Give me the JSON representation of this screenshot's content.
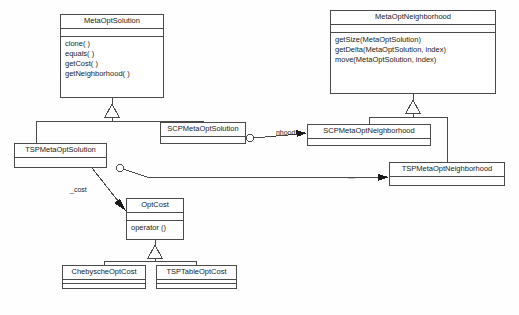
{
  "diagram": {
    "type": "uml-class-diagram",
    "background": "#fefefe",
    "line_color": "#4a4a4a"
  },
  "classes": [
    {
      "id": "meta-opt-solution",
      "name": "MetaOptSolution",
      "x": 60,
      "y": 14,
      "w": 104,
      "h": 84,
      "attrs_h": 7,
      "operations": [
        "clone( )",
        "equals( )",
        "getCost( )",
        "getNeighborhood( )"
      ]
    },
    {
      "id": "meta-opt-neighborhood",
      "name": "MetaOptNeighborhood",
      "x": 330,
      "y": 10,
      "w": 166,
      "h": 84,
      "attrs_h": 7,
      "operations": [
        "getSize(MetaOptSolution)",
        "getDelta(MetaOptSolution, index)",
        "move(MetaOptSolution, index)"
      ]
    },
    {
      "id": "scp-meta-opt-solution",
      "name": "SCPMetaOptSolution",
      "x": 160,
      "y": 122,
      "w": 86,
      "h": 22,
      "attrs_h": 0,
      "operations": []
    },
    {
      "id": "scp-meta-opt-neighborhood",
      "name": "SCPMetaOptNeighborhood",
      "x": 307,
      "y": 124,
      "w": 124,
      "h": 22,
      "attrs_h": 0,
      "operations": []
    },
    {
      "id": "tsp-meta-opt-solution",
      "name": "TSPMetaOptSolution",
      "x": 14,
      "y": 143,
      "w": 93,
      "h": 25,
      "attrs_h": 0,
      "operations": []
    },
    {
      "id": "tsp-meta-opt-neighborhood",
      "name": "TSPMetaOptNeighborhood",
      "x": 389,
      "y": 162,
      "w": 116,
      "h": 24,
      "attrs_h": 0,
      "operations": []
    },
    {
      "id": "opt-cost",
      "name": "OptCost",
      "x": 126,
      "y": 198,
      "w": 58,
      "h": 42,
      "attrs_h": 7,
      "operations": [
        "operator ()"
      ]
    },
    {
      "id": "chebysche-opt-cost",
      "name": "ChebyscheOptCost",
      "x": 62,
      "y": 265,
      "w": 84,
      "h": 24,
      "attrs_h": 7,
      "operations": []
    },
    {
      "id": "tsp-table-opt-cost",
      "name": "TSPTableOptCost",
      "x": 156,
      "y": 265,
      "w": 81,
      "h": 24,
      "attrs_h": 7,
      "operations": []
    }
  ],
  "edge_labels": [
    {
      "id": "nhood",
      "text": "_nhood",
      "x": 272,
      "y": 129
    },
    {
      "id": "cost",
      "text": "_cost",
      "x": 70,
      "y": 186
    },
    {
      "id": "unnamed",
      "text": "—",
      "x": 348,
      "y": 178,
      "faint": true
    }
  ]
}
